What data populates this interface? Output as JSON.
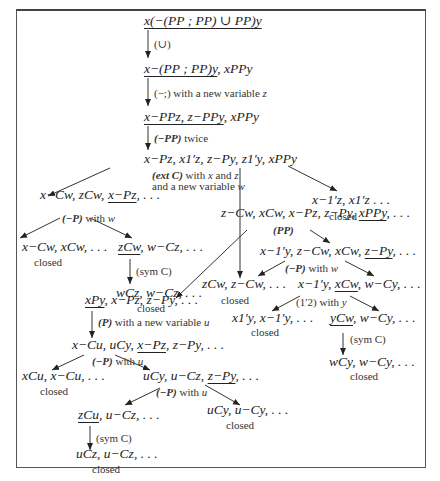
{
  "diagram": {
    "type": "proof-tree",
    "nodes": {
      "n1": {
        "text": "x(−(PP ; PP) ∪ PP)y",
        "underlined": "x(−(PP ; PP) ∪ PP)y"
      },
      "n2": {
        "pre": "",
        "u": "x−(PP ; PP)y",
        "post": ", xPPy"
      },
      "n3": {
        "pre": "",
        "u": "x−PPz, z−PPy",
        "post": ", xPPy"
      },
      "n4": {
        "text": "x−Pz, x1′z, z−Py, z1′y, xPPy"
      },
      "n5": {
        "pre": "x−Cw, zCw, ",
        "u": "x−Pz",
        "post": ", . . ."
      },
      "n6": {
        "text": "x−1′z, x1′z . . .",
        "status": "closed"
      },
      "n7": {
        "text": "x−Cw, xCw, . . .",
        "status": "closed"
      },
      "n8": {
        "pre": "",
        "u": "zCw",
        "post": ", w−Cz, . . ."
      },
      "n9": {
        "text": "wCz, w−Cz, . . .",
        "status": "closed"
      },
      "n10": {
        "pre": "z−Cw, xCw, x−Pz, z−Py, ",
        "u": "xPPy",
        "post": ", . . ."
      },
      "n11": {
        "pre": "x−1′y, z−Cw, xCw, ",
        "u": "z−Py",
        "post": ", . . ."
      },
      "n12": {
        "text": "zCw, z−Cw, . . .",
        "status": "closed"
      },
      "n13": {
        "pre": "x−1′y, ",
        "u": "xCw",
        "post": ", w−Cy, . . ."
      },
      "n14": {
        "text": "x1′y, x−1′y, . . .",
        "status": "closed"
      },
      "n15": {
        "pre": "",
        "u": "yCw",
        "post": ", w−Cy, . . ."
      },
      "n16": {
        "text": "wCy, w−Cy, . . .",
        "status": "closed"
      },
      "n17": {
        "pre": "",
        "u": "xPy",
        "post": ", x−Pz, z−Py, . . ."
      },
      "n18": {
        "pre": "x−Cu, uCy, ",
        "u": "x−Pz",
        "post": ", z−Py, . . ."
      },
      "n19": {
        "text": "xCu, x−Cu, . . .",
        "status": "closed"
      },
      "n20": {
        "pre": "uCy, u−Cz, ",
        "u": "z−Py",
        "post": ", . . ."
      },
      "n21": {
        "pre": "",
        "u": "zCu",
        "post": ", u−Cz, . . ."
      },
      "n22": {
        "text": "uCy, u−Cy, . . .",
        "status": "closed"
      },
      "n23": {
        "text": "uCz, u−Cz, . . .",
        "status": "closed"
      }
    },
    "rules": {
      "r1": "(∪)",
      "r2_rule": "(−;)",
      "r2_text": " with a new variable ",
      "r2_var": "z",
      "r3_rule": "(−PP)",
      "r3_text": " twice",
      "r4_rule": "(ext C)",
      "r4_text1": " with ",
      "r4_x": "x",
      "r4_and": " and ",
      "r4_z": "z",
      "r4_line2": "and a new variable ",
      "r4_w": "w",
      "r5_rule": "(−P)",
      "r5_text": " with ",
      "r5_var": "w",
      "r6": "(sym C)",
      "r7": "(PP)",
      "r8_rule": "(−P)",
      "r8_text": " with ",
      "r8_var": "w",
      "r9_rule": "(1′2)",
      "r9_text": " with ",
      "r9_var": "y",
      "r10": "(sym C)",
      "r11_rule": "(P)",
      "r11_text": " with a new variable ",
      "r11_var": "u",
      "r12_rule": "(−P)",
      "r12_text": " with ",
      "r12_var": "u",
      "r13_rule": "(−P)",
      "r13_text": " with ",
      "r13_var": "u",
      "r14": "(sym C)"
    },
    "closed_label": "closed"
  }
}
